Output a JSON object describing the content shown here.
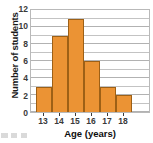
{
  "chart_data": {
    "type": "bar",
    "title": "",
    "subtitle": "",
    "xlabel": "Age (years)",
    "ylabel": "Number of students",
    "categories": [
      "13",
      "14",
      "15",
      "16",
      "17",
      "18"
    ],
    "values": [
      3,
      9,
      11,
      6,
      3,
      2
    ],
    "series": [
      {
        "name": "Number of students",
        "values": [
          3,
          9,
          11,
          6,
          3,
          2
        ]
      }
    ],
    "ylim": [
      0,
      12
    ],
    "ytick_labels": [
      "0",
      "2",
      "4",
      "6",
      "8",
      "10",
      "12"
    ],
    "ytick_values": [
      0,
      2,
      4,
      6,
      8,
      10,
      12
    ],
    "ytick_step": 2,
    "gridline_step": 1,
    "grid": true,
    "grid_axis": "y",
    "legend": false,
    "legend_position": "none",
    "bar_style": "contiguous-histogram",
    "colors": {
      "bar_fill": "#EB9334",
      "bar_border": "#9D6016",
      "gridline": "#C3C3C3",
      "frame": "#B9B9B9",
      "tick_label": "#3A3A3A",
      "axis_title": "#0D0D0D",
      "background": "#FFFFFF"
    }
  }
}
